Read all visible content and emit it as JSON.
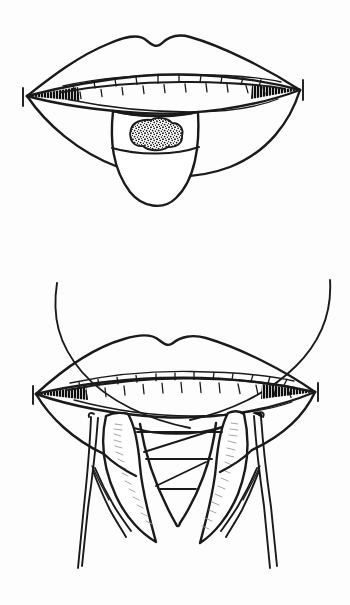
{
  "document": {
    "title": "Wedge excision of tongue lesion",
    "background_color": "#fdfdfd",
    "ink_color": "#1a1a1a",
    "shading_color": "#9a9a9a",
    "style": "line-drawing",
    "width": 350,
    "height": 605
  },
  "figures": [
    {
      "id": "figure-top",
      "label": "Lesion on dorsum of protruded tongue",
      "parts": [
        {
          "name": "upper-lip",
          "label": "Upper lip with cupid's bow"
        },
        {
          "name": "lower-lip",
          "label": "Lower lip"
        },
        {
          "name": "left-commissure",
          "label": "Left oral commissure"
        },
        {
          "name": "right-commissure",
          "label": "Right oral commissure"
        },
        {
          "name": "upper-teeth",
          "label": "Upper dental arch",
          "tooth_count": 10
        },
        {
          "name": "lower-teeth",
          "label": "Lower dental arch",
          "tooth_count": 10
        },
        {
          "name": "tongue",
          "label": "Protruded tongue"
        },
        {
          "name": "lesion",
          "label": "Stippled exophytic lesion on tongue dorsum"
        }
      ]
    },
    {
      "id": "figure-bottom",
      "label": "V-shaped wedge excision with retraction sutures and forceps",
      "parts": [
        {
          "name": "upper-lip",
          "label": "Upper lip with cupid's bow"
        },
        {
          "name": "lower-lip",
          "label": "Lower lip"
        },
        {
          "name": "left-commissure",
          "label": "Left oral commissure"
        },
        {
          "name": "right-commissure",
          "label": "Right oral commissure"
        },
        {
          "name": "upper-teeth",
          "label": "Upper dental arch",
          "tooth_count": 12
        },
        {
          "name": "lower-teeth",
          "label": "Lower dental arch",
          "tooth_count": 12
        },
        {
          "name": "tongue-flap-left",
          "label": "Left tongue flap, cut edge"
        },
        {
          "name": "tongue-flap-right",
          "label": "Right tongue flap, cut edge"
        },
        {
          "name": "wedge-defect",
          "label": "V-shaped wedge defect"
        },
        {
          "name": "suture-line-1",
          "label": "Upper horizontal suture"
        },
        {
          "name": "suture-line-2",
          "label": "Middle horizontal suture"
        },
        {
          "name": "suture-line-3",
          "label": "Lower horizontal suture"
        },
        {
          "name": "traction-suture-left",
          "label": "Left traction suture, crossing"
        },
        {
          "name": "traction-suture-right",
          "label": "Right traction suture, crossing"
        },
        {
          "name": "forceps-left",
          "label": "Left tissue forceps"
        },
        {
          "name": "forceps-right",
          "label": "Right tissue forceps"
        }
      ]
    }
  ]
}
